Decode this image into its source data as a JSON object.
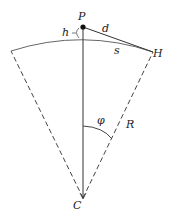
{
  "diagram": {
    "title": "",
    "labels": {
      "P": "P",
      "H": "H",
      "h": "h",
      "d": "d",
      "s": "s",
      "R": "R",
      "phi": "φ",
      "C": "C"
    },
    "points": {
      "P": [
        83,
        27
      ],
      "H": [
        153,
        52
      ],
      "C": [
        83,
        198
      ],
      "arc_left": [
        11,
        51
      ],
      "arc_top": [
        83,
        39
      ]
    },
    "colors": {
      "line": "#333333",
      "arc": "#666666",
      "text": "#222222"
    }
  }
}
